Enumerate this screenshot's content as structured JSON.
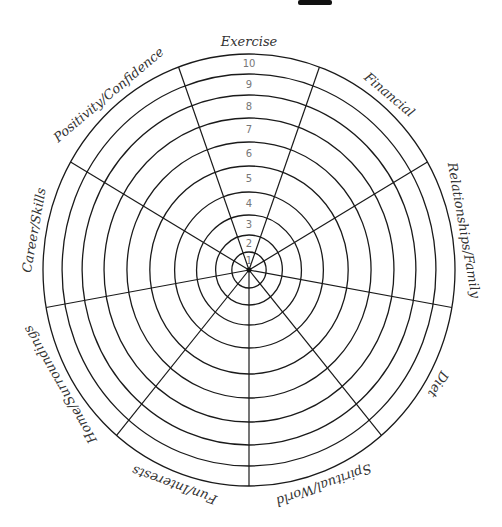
{
  "wheel": {
    "center": [
      249,
      270
    ],
    "outer_rx": 206,
    "outer_ry": 216,
    "ring_radii": [
      18,
      35,
      55,
      78,
      104,
      128,
      152,
      175,
      196,
      216
    ],
    "scale_labels": [
      "1",
      "2",
      "3",
      "4",
      "5",
      "6",
      "7",
      "8",
      "9",
      "10"
    ],
    "spoke_angles_deg": [
      20,
      60,
      100,
      140,
      180,
      220,
      260,
      300,
      340
    ],
    "line_color": "#1a1a1a",
    "number_color": "#777777",
    "label_color": "#333333"
  },
  "categories": [
    {
      "label": "Exercise",
      "angle": 0
    },
    {
      "label": "Financial",
      "angle": 40
    },
    {
      "label": "Relationships/Family",
      "angle": 80
    },
    {
      "label": "Diet",
      "angle": 120
    },
    {
      "label": "Spiritual/World",
      "angle": 160
    },
    {
      "label": "Fun/Interests",
      "angle": 200
    },
    {
      "label": "Home/Surroundings",
      "angle": 240
    },
    {
      "label": "Career/Skills",
      "angle": 280
    },
    {
      "label": "Positivity/Confidence",
      "angle": 320
    }
  ]
}
